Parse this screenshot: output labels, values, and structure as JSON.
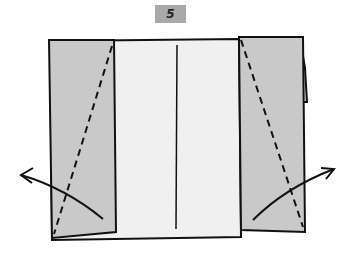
{
  "step": {
    "number": "5"
  },
  "diagram": {
    "colors": {
      "paper": "#f0f0f0",
      "flap": "#c9c9c9",
      "line": "#111111",
      "badge": "#a9a9a9"
    }
  }
}
